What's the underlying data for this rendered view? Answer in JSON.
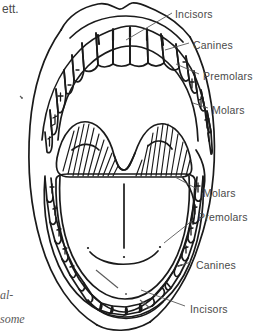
{
  "figure": {
    "ink_color": "#1a1a1a",
    "label_color": "#4a4a4a",
    "background": "#ffffff"
  },
  "labels": {
    "upper": [
      {
        "id": "upper-incisors",
        "text": "Incisors",
        "x": 175,
        "y": 8
      },
      {
        "id": "upper-canines",
        "text": "Canines",
        "x": 193,
        "y": 39
      },
      {
        "id": "upper-premolars",
        "text": "Premolars",
        "x": 203,
        "y": 70
      },
      {
        "id": "upper-molars",
        "text": "Molars",
        "x": 212,
        "y": 104
      }
    ],
    "lower": [
      {
        "id": "lower-molars",
        "text": "Molars",
        "x": 203,
        "y": 187
      },
      {
        "id": "lower-premolars",
        "text": "Premolars",
        "x": 198,
        "y": 211
      },
      {
        "id": "lower-canines",
        "text": "Canines",
        "x": 196,
        "y": 259
      },
      {
        "id": "lower-incisors",
        "text": "Incisors",
        "x": 190,
        "y": 303
      }
    ]
  },
  "page_edge_text": {
    "top_left": "ett.",
    "bottom_left_line1": "al-",
    "bottom_left_line2": "some"
  },
  "anatomy": {
    "upper_lip": "upper-lip-outline",
    "lower_lip": "lower-lip-outline",
    "tongue": "tongue",
    "tongue_median_sulcus": "median-sulcus",
    "soft_palate": "soft-palate-hatched",
    "cheek_left": "left-cheek-outline",
    "cheek_right": "right-cheek-outline"
  }
}
